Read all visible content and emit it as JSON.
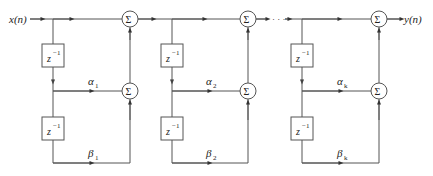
{
  "diagram": {
    "type": "cascaded second-order filter structure",
    "input_label": "x(n)",
    "output_label": "y(n)",
    "sum_symbol": "Σ",
    "delay_label": "z",
    "delay_exponent": "−1",
    "continuation": "· · ·",
    "stages": [
      {
        "alpha": "α",
        "alpha_sub": "1",
        "beta": "β",
        "beta_sub": "1"
      },
      {
        "alpha": "α",
        "alpha_sub": "2",
        "beta": "β",
        "beta_sub": "2"
      },
      {
        "alpha": "α",
        "alpha_sub": "k",
        "beta": "β",
        "beta_sub": "k"
      }
    ],
    "colors": {
      "line": "#555555",
      "text": "#222222",
      "background": "#ffffff"
    }
  }
}
